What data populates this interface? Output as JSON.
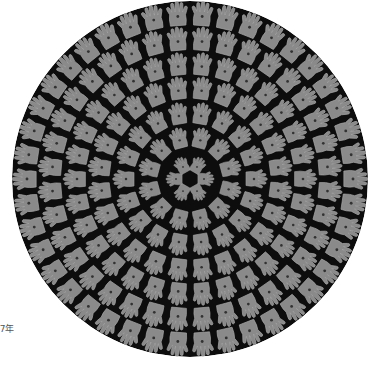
{
  "artwork": {
    "shape": "circle",
    "motif": "hand-prints arranged in concentric rings",
    "center": [
      190,
      179
    ],
    "radius": 178,
    "colors": {
      "background": "#0d0d0d",
      "hand": "#8a8a8a",
      "hand_edge": "#a5a5a5",
      "page": "#ffffff"
    },
    "rings": [
      {
        "radius": 14,
        "count": 6,
        "size": 16
      },
      {
        "radius": 40,
        "count": 12,
        "size": 20
      },
      {
        "radius": 64,
        "count": 18,
        "size": 21
      },
      {
        "radius": 89,
        "count": 24,
        "size": 22
      },
      {
        "radius": 113,
        "count": 30,
        "size": 22
      },
      {
        "radius": 138,
        "count": 36,
        "size": 23
      },
      {
        "radius": 163,
        "count": 42,
        "size": 24
      }
    ]
  },
  "caption": {
    "text": "97年"
  }
}
